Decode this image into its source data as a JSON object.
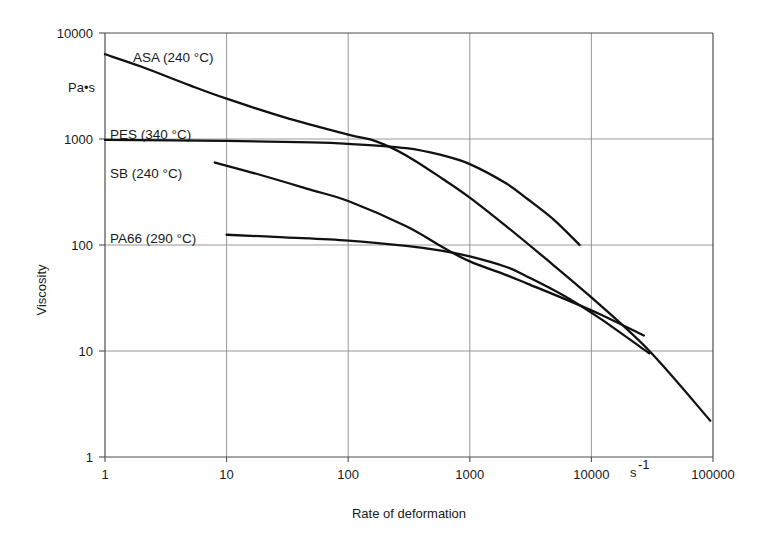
{
  "chart_data": {
    "type": "line",
    "title": "",
    "xlabel": "Rate of deformation",
    "ylabel": "Viscosity",
    "x_unit": "s",
    "x_unit_exponent": "-1",
    "y_unit": "Pa•s",
    "x_scale": "log",
    "y_scale": "log",
    "xlim": [
      1,
      100000
    ],
    "ylim": [
      1,
      10000
    ],
    "x_ticks": [
      "1",
      "10",
      "100",
      "1000",
      "10000",
      "100000"
    ],
    "x_tick_values": [
      1,
      10,
      100,
      1000,
      10000,
      100000
    ],
    "y_ticks": [
      "1",
      "10",
      "100",
      "1000",
      "10000"
    ],
    "y_tick_values": [
      1,
      10,
      100,
      1000,
      10000
    ],
    "grid": true,
    "legend_position": "inline-annotations",
    "series": [
      {
        "name": "ASA (240 °C)",
        "label": "ASA (240 °C)",
        "temperature_c": 240,
        "points": [
          [
            1,
            6300
          ],
          [
            2,
            4800
          ],
          [
            5,
            3200
          ],
          [
            10,
            2400
          ],
          [
            30,
            1600
          ],
          [
            100,
            1100
          ],
          [
            170,
            950
          ],
          [
            300,
            700
          ],
          [
            600,
            420
          ],
          [
            1000,
            280
          ],
          [
            2000,
            150
          ],
          [
            4000,
            78
          ],
          [
            10000,
            32
          ],
          [
            30000,
            10
          ],
          [
            95000,
            2.2
          ]
        ]
      },
      {
        "name": "PES (340 °C)",
        "label": "PES (340 °C)",
        "temperature_c": 340,
        "points": [
          [
            1,
            980
          ],
          [
            10,
            960
          ],
          [
            50,
            930
          ],
          [
            100,
            900
          ],
          [
            300,
            820
          ],
          [
            600,
            700
          ],
          [
            1000,
            580
          ],
          [
            2000,
            380
          ],
          [
            3000,
            270
          ],
          [
            5000,
            170
          ],
          [
            8000,
            100
          ]
        ]
      },
      {
        "name": "SB  (240 °C)",
        "label": "SB  (240 °C)",
        "temperature_c": 240,
        "points": [
          [
            8,
            600
          ],
          [
            20,
            450
          ],
          [
            50,
            330
          ],
          [
            100,
            260
          ],
          [
            300,
            150
          ],
          [
            600,
            95
          ],
          [
            1000,
            70
          ],
          [
            2000,
            52
          ],
          [
            3000,
            43
          ],
          [
            6000,
            31
          ],
          [
            12000,
            22
          ],
          [
            27000,
            14
          ]
        ]
      },
      {
        "name": "PA66 (290 °C)",
        "label": "PA66 (290 °C)",
        "temperature_c": 290,
        "points": [
          [
            10,
            125
          ],
          [
            30,
            118
          ],
          [
            100,
            110
          ],
          [
            300,
            98
          ],
          [
            600,
            88
          ],
          [
            1000,
            78
          ],
          [
            2000,
            62
          ],
          [
            3000,
            50
          ],
          [
            6000,
            33
          ],
          [
            12000,
            20
          ],
          [
            25000,
            11
          ],
          [
            30000,
            9.5
          ]
        ]
      }
    ],
    "annotations": [
      {
        "text": "ASA (240 °C)",
        "x_px": 133,
        "y_px": 62
      },
      {
        "text": "PES (340 °C)",
        "x_px": 110,
        "y_px": 139
      },
      {
        "text": "SB  (240 °C)",
        "x_px": 110,
        "y_px": 178
      },
      {
        "text": "PA66 (290 °C)",
        "x_px": 110,
        "y_px": 243
      }
    ]
  },
  "labels": {
    "y_unit": "Pa•s",
    "y_axis_title": "Viscosity",
    "x_axis_title": "Rate of deformation",
    "x_unit_base": "s",
    "x_unit_exp": "-1"
  },
  "colors": {
    "background": "#ffffff",
    "curve": "#111111",
    "grid": "#8c8c8c",
    "axis": "#4d4d4d",
    "text": "#1a1a1a"
  }
}
